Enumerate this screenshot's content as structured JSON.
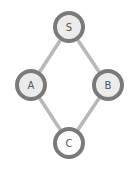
{
  "diagram": {
    "type": "graph",
    "directed": false,
    "colors": {
      "edge": "#b8b8b8",
      "node_stroke": "#7a7a7a",
      "node_fill_default": "#ebebeb",
      "node_fill_highlight": "#ffffff",
      "label": "#555555"
    },
    "nodes": [
      {
        "id": "S",
        "label": "S",
        "x": 69,
        "y": 27,
        "r": 14,
        "fill": "#ebebeb"
      },
      {
        "id": "A",
        "label": "A",
        "x": 31,
        "y": 85,
        "r": 14,
        "fill": "#ebebeb"
      },
      {
        "id": "B",
        "label": "B",
        "x": 108,
        "y": 85,
        "r": 14,
        "fill": "#ebebeb"
      },
      {
        "id": "C",
        "label": "C",
        "x": 69,
        "y": 143,
        "r": 14,
        "fill": "#ffffff"
      }
    ],
    "edges": [
      {
        "from": "S",
        "to": "A"
      },
      {
        "from": "S",
        "to": "B"
      },
      {
        "from": "A",
        "to": "C"
      },
      {
        "from": "B",
        "to": "C"
      }
    ]
  }
}
